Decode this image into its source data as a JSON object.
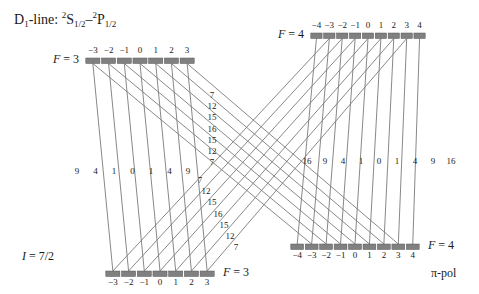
{
  "title": {
    "prefix": "D",
    "prefix_sub": "1",
    "mid": "-line: ",
    "term_a_sup": "2",
    "term_a": "S",
    "term_a_sub": "1/2",
    "dash": "–",
    "term_b_sup": "2",
    "term_b": "P",
    "term_b_sub": "1/2",
    "plain": "D1-line: 2S1/2 - 2P1/2"
  },
  "nuclear_spin_label": {
    "symbol": "I",
    "value": " = 7/2"
  },
  "polarization_label": "π-pol",
  "colors": {
    "level_bar": "#808080",
    "level_bar_edge": "#595959",
    "transition_line": "#7a7a7a",
    "text": "#1a1a1a",
    "background": "#ffffff"
  },
  "levels": [
    {
      "id": "upper-left",
      "name": "ground-F3-upper",
      "F_prefix": "F",
      "F_value": " = 3",
      "F_label_side": "left",
      "m_label_side": "above",
      "m_values": [
        "−3",
        "−2",
        "−1",
        "0",
        "1",
        "2",
        "3"
      ],
      "bar_y": 58,
      "bar_x_start": 85,
      "bar_x_end": 195,
      "segments": 7
    },
    {
      "id": "upper-right",
      "name": "excited-F4-upper",
      "F_prefix": "F",
      "F_value": " = 4",
      "F_label_side": "left",
      "m_label_side": "above",
      "m_values": [
        "−4",
        "−3",
        "−2",
        "−1",
        "0",
        "1",
        "2",
        "3",
        "4"
      ],
      "bar_y": 33,
      "bar_x_start": 310,
      "bar_x_end": 426,
      "segments": 9
    },
    {
      "id": "lower-left",
      "name": "ground-F3-lower",
      "F_prefix": "F",
      "F_value": " = 3",
      "F_label_side": "right",
      "m_label_side": "below",
      "m_values": [
        "−3",
        "−2",
        "−1",
        "0",
        "1",
        "2",
        "3"
      ],
      "bar_y": 271,
      "bar_x_start": 105,
      "bar_x_end": 215,
      "segments": 7
    },
    {
      "id": "lower-right",
      "name": "excited-F4-lower",
      "F_prefix": "F",
      "F_value": " = 4",
      "F_label_side": "right",
      "m_label_side": "below",
      "m_values": [
        "−4",
        "−3",
        "−2",
        "−1",
        "0",
        "1",
        "2",
        "3",
        "4"
      ],
      "bar_y": 244,
      "bar_x_start": 290,
      "bar_x_end": 420,
      "segments": 9
    }
  ],
  "chart_data": {
    "type": "diagram",
    "strength_groups": [
      {
        "name": "left-vertical-F3-to-F3",
        "from": "upper-left F=3",
        "to": "lower-left F=3",
        "orientation": "near-vertical",
        "values": [
          9,
          4,
          1,
          0,
          1,
          4,
          9
        ],
        "label_y": 166,
        "label_x_start": 77,
        "label_x_step": 18.5
      },
      {
        "name": "right-vertical-F4-to-F4",
        "from": "upper-right F=4",
        "to": "lower-right F=4",
        "orientation": "near-vertical",
        "values": [
          16,
          9,
          4,
          1,
          0,
          1,
          4,
          9,
          16
        ],
        "label_y": 156,
        "label_x_start": 307,
        "label_x_step": 18.0
      },
      {
        "name": "upper-diagonal-F3-to-F4",
        "from": "upper-left F=3",
        "to": "lower-right F=4",
        "orientation": "diagonal-descending",
        "values": [
          7,
          12,
          15,
          16,
          15,
          12,
          7
        ],
        "label_x": 212,
        "label_y_start": 90,
        "label_y_step": 11.2
      },
      {
        "name": "lower-diagonal-F4-to-F3",
        "from": "upper-right F=4",
        "to": "lower-left F=3",
        "orientation": "diagonal-ascending",
        "values": [
          7,
          12,
          15,
          16,
          15,
          12,
          7
        ],
        "label_x_start": 200,
        "label_x_step": 6.0,
        "label_y_start": 175,
        "label_y_step": 11.2
      }
    ],
    "axis_note": "no numeric axes; schematic energy-level diagram"
  }
}
